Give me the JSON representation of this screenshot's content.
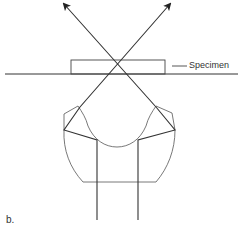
{
  "figure": {
    "label": "b.",
    "specimen_label": "Specimen"
  },
  "colors": {
    "line": "#333333",
    "thin_line": "#555555",
    "background": "#ffffff"
  }
}
